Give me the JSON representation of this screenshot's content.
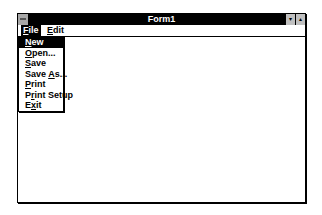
{
  "window": {
    "title": "Form1",
    "system_menu_icon": "system-menu-icon",
    "minimize_icon": "▾",
    "maximize_icon": "▴"
  },
  "menubar": {
    "items": [
      {
        "label": "File",
        "mnemonic_index": 0,
        "active": true
      },
      {
        "label": "Edit",
        "mnemonic_index": 0,
        "active": false
      }
    ]
  },
  "file_menu": {
    "items": [
      {
        "pre": "",
        "u": "N",
        "post": "ew",
        "active": true
      },
      {
        "pre": "",
        "u": "O",
        "post": "pen...",
        "active": false
      },
      {
        "pre": "",
        "u": "S",
        "post": "ave",
        "active": false
      },
      {
        "pre": "Save ",
        "u": "A",
        "post": "s...",
        "active": false
      },
      {
        "pre": "",
        "u": "P",
        "post": "rint",
        "active": false
      },
      {
        "pre": "P",
        "u": "r",
        "post": "int Setup",
        "active": false
      },
      {
        "pre": "E",
        "u": "x",
        "post": "it",
        "active": false
      }
    ]
  },
  "client_area": {
    "grid": "dotted design grid"
  }
}
